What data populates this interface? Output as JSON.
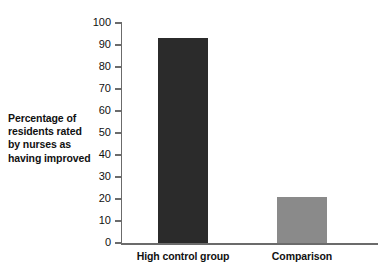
{
  "chart_data": {
    "type": "bar",
    "title": "",
    "subtitle": "",
    "xlabel": "",
    "ylabel": "Percentage of residents rated by nurses as having improved",
    "ylabel_lines": [
      "Percentage of",
      "residents rated",
      "by nurses as",
      "having improved"
    ],
    "categories": [
      "High control group",
      "Comparison"
    ],
    "values": [
      93,
      21
    ],
    "ylim": [
      0,
      100
    ],
    "yticks": [
      0,
      10,
      20,
      30,
      40,
      50,
      60,
      70,
      80,
      90,
      100
    ],
    "ytick_labels": [
      "0",
      "10",
      "20",
      "30",
      "40",
      "50",
      "60",
      "70",
      "80",
      "90",
      "100"
    ],
    "grid": false,
    "legend": false,
    "legend_position": "none",
    "bar_colors": [
      "#2b2b2b",
      "#8a8a8a"
    ],
    "axis_color": "#6b6b6b",
    "background_color": "#ffffff",
    "text_color": "#111111"
  },
  "bars": [
    {
      "category": "High control group",
      "value": 93,
      "color": "#2b2b2b"
    },
    {
      "category": "Comparison",
      "value": 21,
      "color": "#8a8a8a"
    }
  ]
}
